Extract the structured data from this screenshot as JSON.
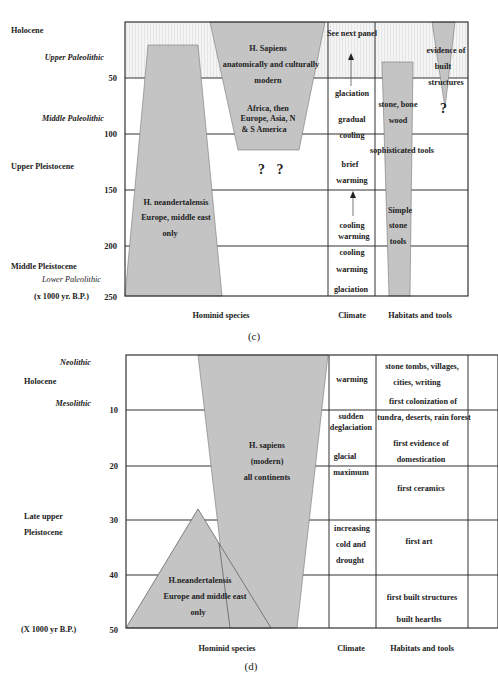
{
  "panel_c": {
    "caption": "(c)",
    "epochs": {
      "holocene": "Holocene",
      "upper_paleolithic": "Upper Paleolithic",
      "middle_paleolithic": "Middle Paleolithic",
      "upper_pleistocene": "Upper Pleistocene",
      "middle_pleistocene": "Middle Pleistocene",
      "lower_paleolithic": "Lower Paleolithic",
      "units": "(x 1000 yr. B.P.)"
    },
    "ticks": [
      "50",
      "100",
      "150",
      "200",
      "250"
    ],
    "column_headers": {
      "hominid": "Hominid species",
      "climate": "Climate",
      "habitats": "Habitats and tools"
    },
    "hominid": {
      "sapiens": [
        "H. Sapiens",
        "anatomically and culturally",
        "modern",
        "Africa, then",
        "Europe, Asia, N",
        "& S America"
      ],
      "question": "? ?",
      "neandertal": [
        "H. neandertalensis",
        "Europe, middle east",
        "only"
      ]
    },
    "climate": [
      "See next panel",
      "glaciation",
      "gradual",
      "cooling",
      "brief",
      "warming",
      "cooling",
      "warming",
      "cooling",
      "warming",
      "glaciation"
    ],
    "habitats": {
      "built": [
        "evidence of",
        "built",
        "structures"
      ],
      "question": "?",
      "bone": [
        "stone, bone",
        "wood"
      ],
      "sophisticated": "sophisticated tools",
      "simple": [
        "Simple",
        "stone",
        "tools"
      ]
    }
  },
  "panel_d": {
    "caption": "(d)",
    "epochs": {
      "neolithic": "Neolithic",
      "holocene": "Holocene",
      "mesolithic": "Mesolithic",
      "late_upper": "Late upper",
      "pleistocene": "Pleistocene",
      "units": "(X 1000 yr B.P.)"
    },
    "ticks": [
      "10",
      "20",
      "30",
      "40",
      "50"
    ],
    "column_headers": {
      "hominid": "Hominid species",
      "climate": "Climate",
      "habitats": "Habitats and tools"
    },
    "hominid": {
      "sapiens": [
        "H. sapiens",
        "(modern)",
        "all continents"
      ],
      "neandertal": [
        "H.neandertalensis",
        "Europe and middle east",
        "only"
      ]
    },
    "climate": [
      "warming",
      "sudden",
      "deglaciation",
      "glacial",
      "maximum",
      "increasing",
      "cold and",
      "drought"
    ],
    "habitats": [
      "stone tombs, villages,",
      "cities, writing",
      "first colonization of",
      "tundra, deserts, rain forest",
      "first evidence of",
      "domestication",
      "first ceramics",
      "first art",
      "first built structures",
      "built hearths"
    ]
  },
  "colors": {
    "fill": "#c4c4c4",
    "line": "#333333",
    "band": "#f1f1f1"
  }
}
